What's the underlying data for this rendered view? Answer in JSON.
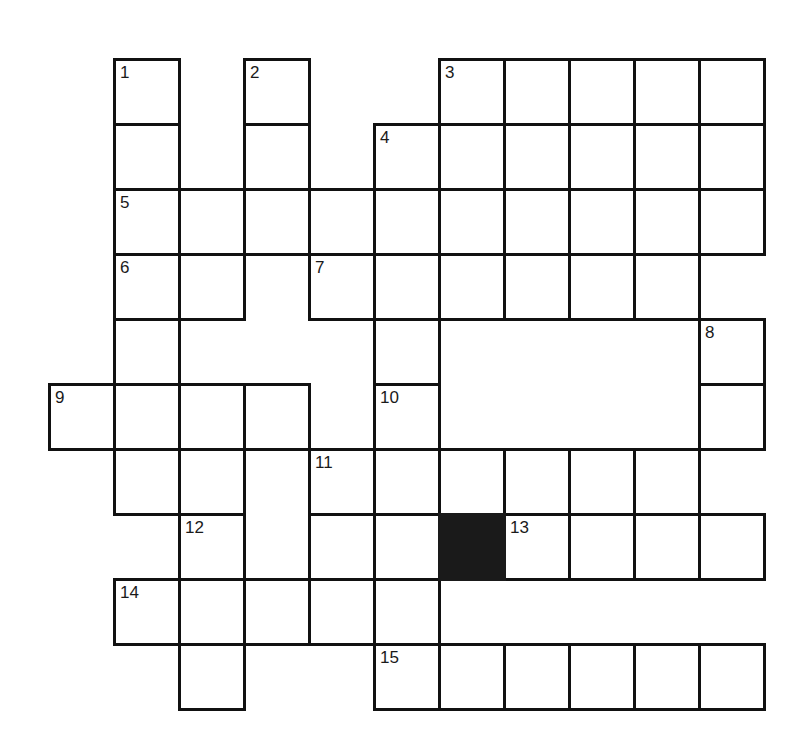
{
  "puzzle": {
    "title": "Crossword Puzzle Grid",
    "type": "crossword",
    "columns": 11,
    "rows": 10,
    "cell_size": 65,
    "origin_x": 48,
    "origin_y": 58,
    "ink_color": "#111111",
    "blocked_color": "#1a1a1a",
    "background_color": "#ffffff",
    "clue_count": 15,
    "blocked_cell_count": 1
  },
  "cells": [
    {
      "col": 1,
      "row": 0
    },
    {
      "col": 3,
      "row": 0
    },
    {
      "col": 6,
      "row": 0
    },
    {
      "col": 7,
      "row": 0
    },
    {
      "col": 8,
      "row": 0
    },
    {
      "col": 9,
      "row": 0
    },
    {
      "col": 10,
      "row": 0
    },
    {
      "col": 1,
      "row": 1
    },
    {
      "col": 3,
      "row": 1
    },
    {
      "col": 5,
      "row": 1
    },
    {
      "col": 6,
      "row": 1
    },
    {
      "col": 7,
      "row": 1
    },
    {
      "col": 8,
      "row": 1
    },
    {
      "col": 9,
      "row": 1
    },
    {
      "col": 10,
      "row": 1
    },
    {
      "col": 1,
      "row": 2
    },
    {
      "col": 2,
      "row": 2
    },
    {
      "col": 3,
      "row": 2
    },
    {
      "col": 4,
      "row": 2
    },
    {
      "col": 5,
      "row": 2
    },
    {
      "col": 6,
      "row": 2
    },
    {
      "col": 7,
      "row": 2
    },
    {
      "col": 8,
      "row": 2
    },
    {
      "col": 9,
      "row": 2
    },
    {
      "col": 10,
      "row": 2
    },
    {
      "col": 1,
      "row": 3
    },
    {
      "col": 2,
      "row": 3
    },
    {
      "col": 4,
      "row": 3
    },
    {
      "col": 5,
      "row": 3
    },
    {
      "col": 6,
      "row": 3
    },
    {
      "col": 7,
      "row": 3
    },
    {
      "col": 8,
      "row": 3
    },
    {
      "col": 9,
      "row": 3
    },
    {
      "col": 1,
      "row": 4
    },
    {
      "col": 5,
      "row": 4
    },
    {
      "col": 10,
      "row": 4
    },
    {
      "col": 0,
      "row": 5
    },
    {
      "col": 1,
      "row": 5
    },
    {
      "col": 2,
      "row": 5
    },
    {
      "col": 3,
      "row": 5
    },
    {
      "col": 5,
      "row": 5
    },
    {
      "col": 10,
      "row": 5
    },
    {
      "col": 1,
      "row": 6
    },
    {
      "col": 2,
      "row": 6
    },
    {
      "col": 4,
      "row": 6
    },
    {
      "col": 5,
      "row": 6
    },
    {
      "col": 6,
      "row": 6
    },
    {
      "col": 7,
      "row": 6
    },
    {
      "col": 8,
      "row": 6
    },
    {
      "col": 9,
      "row": 6
    },
    {
      "col": 2,
      "row": 7
    },
    {
      "col": 4,
      "row": 7
    },
    {
      "col": 5,
      "row": 7
    },
    {
      "col": 7,
      "row": 7
    },
    {
      "col": 8,
      "row": 7
    },
    {
      "col": 9,
      "row": 7
    },
    {
      "col": 10,
      "row": 7
    },
    {
      "col": 1,
      "row": 8
    },
    {
      "col": 2,
      "row": 8
    },
    {
      "col": 3,
      "row": 8
    },
    {
      "col": 4,
      "row": 8
    },
    {
      "col": 5,
      "row": 8
    },
    {
      "col": 2,
      "row": 9
    },
    {
      "col": 5,
      "row": 9
    },
    {
      "col": 6,
      "row": 9
    },
    {
      "col": 7,
      "row": 9
    },
    {
      "col": 8,
      "row": 9
    },
    {
      "col": 9,
      "row": 9
    },
    {
      "col": 10,
      "row": 9
    }
  ],
  "blocked_cells": [
    {
      "col": 6,
      "row": 7
    }
  ],
  "clue_numbers": [
    {
      "label": "1",
      "col": 1,
      "row": 0
    },
    {
      "label": "2",
      "col": 3,
      "row": 0
    },
    {
      "label": "3",
      "col": 6,
      "row": 0
    },
    {
      "label": "4",
      "col": 5,
      "row": 1
    },
    {
      "label": "5",
      "col": 1,
      "row": 2
    },
    {
      "label": "6",
      "col": 1,
      "row": 3
    },
    {
      "label": "7",
      "col": 4,
      "row": 3
    },
    {
      "label": "8",
      "col": 10,
      "row": 4
    },
    {
      "label": "9",
      "col": 0,
      "row": 5
    },
    {
      "label": "10",
      "col": 5,
      "row": 5
    },
    {
      "label": "11",
      "col": 4,
      "row": 6
    },
    {
      "label": "12",
      "col": 2,
      "row": 7
    },
    {
      "label": "13",
      "col": 7,
      "row": 7
    },
    {
      "label": "14",
      "col": 1,
      "row": 8
    },
    {
      "label": "15",
      "col": 5,
      "row": 9
    }
  ]
}
